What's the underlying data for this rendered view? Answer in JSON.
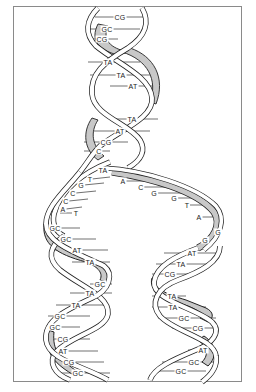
{
  "figure": {
    "colors": {
      "strand_fill": "#ffffff",
      "strand_shade": "#c8c8c8",
      "outline": "#222222",
      "frame": "#8a8a8a"
    }
  },
  "parent_helix": {
    "base_pairs": [
      {
        "label": "CG",
        "x": 120,
        "y": 17
      },
      {
        "label": "GC",
        "x": 107,
        "y": 29
      },
      {
        "label": "CG",
        "x": 102,
        "y": 39
      },
      {
        "label": "TA",
        "x": 108,
        "y": 62
      },
      {
        "label": "TA",
        "x": 121,
        "y": 75
      },
      {
        "label": "AT",
        "x": 133,
        "y": 86
      },
      {
        "label": "TA",
        "x": 132,
        "y": 119
      },
      {
        "label": "AT",
        "x": 120,
        "y": 131
      },
      {
        "label": "CG",
        "x": 106,
        "y": 142
      },
      {
        "label": "C",
        "x": 99,
        "y": 151
      },
      {
        "label": "TA",
        "x": 103,
        "y": 170
      }
    ]
  },
  "fork": {
    "left_strand_bases": [
      {
        "label": "T",
        "x": 90,
        "y": 179
      },
      {
        "label": "G",
        "x": 81,
        "y": 185
      },
      {
        "label": "C",
        "x": 73,
        "y": 193
      },
      {
        "label": "C",
        "x": 66,
        "y": 201
      },
      {
        "label": "A",
        "x": 63,
        "y": 209
      },
      {
        "label": "T",
        "x": 76,
        "y": 213
      }
    ],
    "right_strand_bases": [
      {
        "label": "A",
        "x": 123,
        "y": 181
      },
      {
        "label": "C",
        "x": 141,
        "y": 187
      },
      {
        "label": "G",
        "x": 154,
        "y": 193
      },
      {
        "label": "G",
        "x": 174,
        "y": 198
      },
      {
        "label": "T",
        "x": 187,
        "y": 205
      },
      {
        "label": "A",
        "x": 199,
        "y": 217
      },
      {
        "label": "G",
        "x": 218,
        "y": 232
      },
      {
        "label": "G",
        "x": 205,
        "y": 240
      }
    ]
  },
  "left_daughter_helix": {
    "base_pairs": [
      {
        "label": "GC",
        "x": 55,
        "y": 228
      },
      {
        "label": "GC",
        "x": 66,
        "y": 239
      },
      {
        "label": "AT",
        "x": 77,
        "y": 250
      },
      {
        "label": "TA",
        "x": 90,
        "y": 262
      },
      {
        "label": "GC",
        "x": 100,
        "y": 284
      },
      {
        "label": "TA",
        "x": 90,
        "y": 293
      },
      {
        "label": "TA",
        "x": 76,
        "y": 305
      },
      {
        "label": "GC",
        "x": 60,
        "y": 316
      },
      {
        "label": "GC",
        "x": 55,
        "y": 327
      },
      {
        "label": "CG",
        "x": 63,
        "y": 339
      },
      {
        "label": "AT",
        "x": 63,
        "y": 351
      },
      {
        "label": "CG",
        "x": 69,
        "y": 362
      },
      {
        "label": "GC",
        "x": 78,
        "y": 373
      }
    ]
  },
  "right_daughter_helix": {
    "base_pairs": [
      {
        "label": "AT",
        "x": 192,
        "y": 253
      },
      {
        "label": "TA",
        "x": 181,
        "y": 264
      },
      {
        "label": "CG",
        "x": 170,
        "y": 274
      },
      {
        "label": "TA",
        "x": 172,
        "y": 296
      },
      {
        "label": "TA",
        "x": 173,
        "y": 307
      },
      {
        "label": "GC",
        "x": 184,
        "y": 318
      },
      {
        "label": "CG",
        "x": 198,
        "y": 328
      },
      {
        "label": "AT",
        "x": 203,
        "y": 350
      },
      {
        "label": "GC",
        "x": 194,
        "y": 362
      },
      {
        "label": "GC",
        "x": 181,
        "y": 371
      }
    ]
  }
}
